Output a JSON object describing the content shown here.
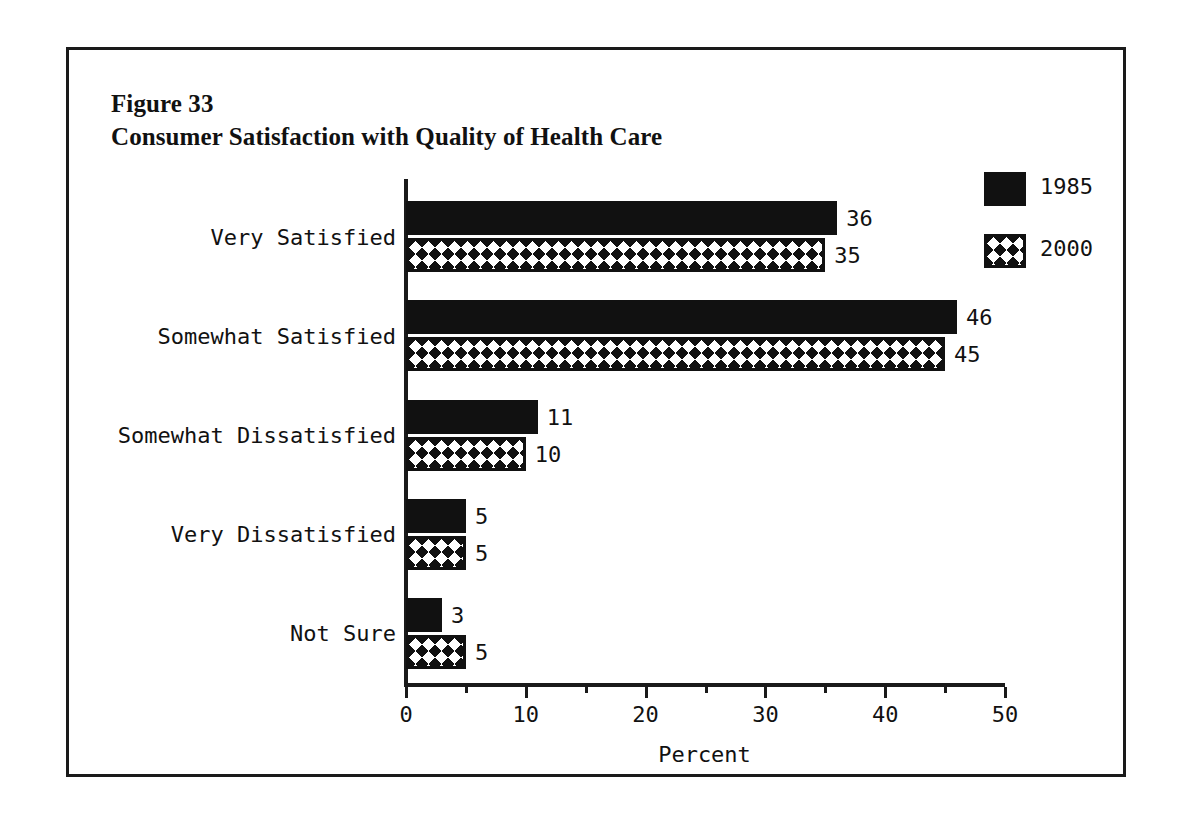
{
  "figure": {
    "number_label": "Figure 33",
    "title": "Consumer Satisfaction with Quality of Health Care"
  },
  "chart_data": {
    "type": "bar",
    "orientation": "horizontal",
    "title": "Consumer Satisfaction with Quality of Health Care",
    "subtitle": "Figure 33",
    "xlabel": "Percent",
    "ylabel": "",
    "xlim": [
      0,
      50
    ],
    "xticks": [
      0,
      10,
      20,
      30,
      40,
      50
    ],
    "xtick_labels": [
      "0",
      "10",
      "20",
      "30",
      "40",
      "50"
    ],
    "xminor_ticks": [
      5,
      15,
      25,
      35,
      45
    ],
    "grid": false,
    "legend_position": "top-right",
    "categories": [
      "Very Satisfied",
      "Somewhat Satisfied",
      "Somewhat Dissatisfied",
      "Very Dissatisfied",
      "Not Sure"
    ],
    "series": [
      {
        "name": "1985",
        "fill": "solid-black",
        "values": [
          36,
          46,
          11,
          5,
          3
        ],
        "value_labels": [
          "36",
          "46",
          "11",
          "5",
          "3"
        ]
      },
      {
        "name": "2000",
        "fill": "cross-hatch",
        "values": [
          35,
          45,
          10,
          5,
          5
        ],
        "value_labels": [
          "35",
          "45",
          "10",
          "5",
          "5"
        ]
      }
    ]
  },
  "colors": {
    "ink": "#111111",
    "frame": "#1a1a1a",
    "background": "#ffffff"
  }
}
